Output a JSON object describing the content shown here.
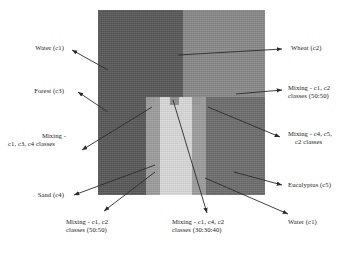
{
  "figure": {
    "background_color": "#ffffff"
  },
  "map": {
    "name": "classified-land-cover-map",
    "x": 98,
    "y": 10,
    "width": 167,
    "height": 185,
    "regions": [
      {
        "id": "forest",
        "class_code": "c3",
        "label": "Forest (c3)",
        "color": "#595959",
        "position": "left"
      },
      {
        "id": "wheat",
        "class_code": "c2",
        "label": "Wheat (c2)",
        "color": "#8a8a8a",
        "position": "upper-right"
      },
      {
        "id": "eucalyptus",
        "class_code": "c5",
        "label": "Eucalyptus (c5)",
        "color": "#6e6e6e",
        "position": "lower-right"
      },
      {
        "id": "sand-left",
        "class_code": "c4",
        "label": "Sand (c4)",
        "color": "#9e9e9e",
        "position": "center-left-band"
      },
      {
        "id": "sand-right",
        "class_code": "c4",
        "label": "Sand (c4)",
        "color": "#9e9e9e",
        "position": "center-right-band"
      },
      {
        "id": "water",
        "class_code": "c1",
        "label": "Water (c1)",
        "color": "#d9d9d9",
        "position": "center-river"
      }
    ]
  },
  "labels": {
    "water_top_left": {
      "lines": [
        "Water (c1)"
      ]
    },
    "forest_left": {
      "lines": [
        "Forest (c3)"
      ]
    },
    "mixing_left_mid": {
      "lines": [
        "Mixing -",
        "c1, c3, c4 classes"
      ]
    },
    "sand_left": {
      "lines": [
        "Sand (c4)"
      ]
    },
    "wheat_right": {
      "lines": [
        "Wheat (c2)"
      ]
    },
    "mixing_right_top": {
      "lines": [
        "Mixing - c1, c2",
        "classes (50:50)"
      ]
    },
    "mixing_right_mid": {
      "lines": [
        "Mixing - c4, c5,",
        "c2 classes"
      ]
    },
    "eucalyptus_right": {
      "lines": [
        "Eucalyptus (c5)"
      ]
    },
    "water_bottom_right": {
      "lines": [
        "Water (c1)"
      ]
    },
    "mixing_bottom_left": {
      "lines": [
        "Mixing - c1, c2",
        "classes (50:50)"
      ]
    },
    "mixing_bottom_mid": {
      "lines": [
        "Mixing - c1, c4, c2",
        "classes (30:30:40)"
      ]
    }
  },
  "legend_classes": [
    {
      "code": "c1",
      "name": "Water"
    },
    {
      "code": "c2",
      "name": "Wheat"
    },
    {
      "code": "c3",
      "name": "Forest"
    },
    {
      "code": "c4",
      "name": "Sand"
    },
    {
      "code": "c5",
      "name": "Eucalyptus"
    }
  ],
  "mixing_ratios": [
    {
      "classes": "c1, c2",
      "ratio": "50:50"
    },
    {
      "classes": "c1, c2",
      "ratio": "50:50"
    },
    {
      "classes": "c1, c4, c2",
      "ratio": "30:30:40"
    },
    {
      "classes": "c1, c3, c4",
      "ratio": ""
    },
    {
      "classes": "c4, c5, c2",
      "ratio": ""
    }
  ],
  "colors": {
    "forest": "#595959",
    "wheat": "#8a8a8a",
    "eucalyptus": "#6e6e6e",
    "sand": "#9e9e9e",
    "water": "#d9d9d9",
    "leader_line": "#2b2b2b",
    "text": "#1a1a1a"
  }
}
